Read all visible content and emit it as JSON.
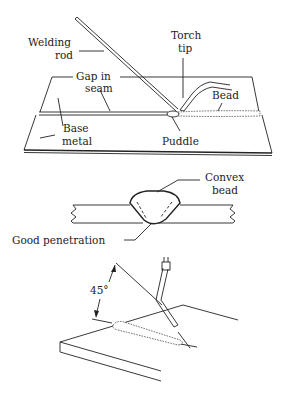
{
  "figure": {
    "panels": [
      {
        "id": "top",
        "title": "Gas welding setup",
        "labels": {
          "welding_rod_line1": "Welding",
          "welding_rod_line2": "rod",
          "torch_tip_line1": "Torch",
          "torch_tip_line2": "tip",
          "gap_line1": "Gap in",
          "gap_line2": "seam",
          "bead": "Bead",
          "base_line1": "Base",
          "base_line2": "metal",
          "puddle": "Puddle"
        }
      },
      {
        "id": "middle",
        "title": "Weld cross-section",
        "labels": {
          "convex_line1": "Convex",
          "convex_line2": "bead",
          "penetration": "Good penetration"
        }
      },
      {
        "id": "bottom",
        "title": "Torch angle",
        "labels": {
          "angle": "45°"
        },
        "angle_degrees": 45
      }
    ],
    "colors": {
      "ink": "#222222",
      "background": "#ffffff"
    }
  }
}
